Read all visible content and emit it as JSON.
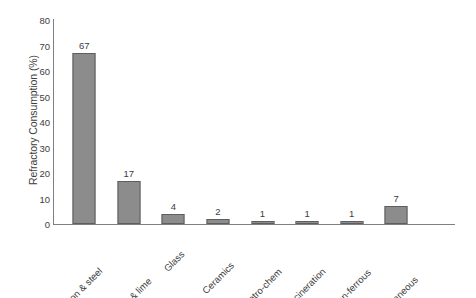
{
  "chart_data": {
    "type": "bar",
    "title": "",
    "xlabel": "",
    "ylabel": "Refractory Consumption (%)",
    "categories": [
      "Iron & steel",
      "Cement & lime",
      "Glass",
      "Ceramics",
      "Petro-chem",
      "incineration",
      "Non-ferrous",
      "Miscellaneous"
    ],
    "values": [
      67,
      17,
      4,
      2,
      1,
      1,
      1,
      7
    ],
    "value_labels": [
      "67",
      "17",
      "4",
      "2",
      "1",
      "1",
      "1",
      "7"
    ],
    "ylim": [
      0,
      80
    ],
    "ytick_labels": [
      "80",
      "70",
      "60",
      "50",
      "40",
      "30",
      "20",
      "10",
      "0"
    ],
    "ytick_values": [
      80,
      70,
      60,
      50,
      40,
      30,
      20,
      10,
      0
    ],
    "grid": false,
    "legend": false,
    "legend_position": "none",
    "colors": {
      "bar_fill": "#8c8c8c",
      "bar_border": "#5e5e5e",
      "axis_line": "#808080",
      "text": "#3d3d3d",
      "background": "#ffffff"
    }
  }
}
